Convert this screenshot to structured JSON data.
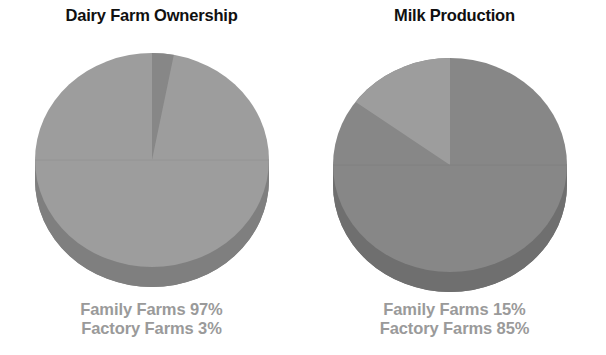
{
  "page": {
    "background": "#ffffff",
    "width": 606,
    "height": 355
  },
  "colors": {
    "title_text": "#101010",
    "legend_text": "#9a9a9a",
    "slice_light": "#9d9d9d",
    "slice_dark": "#878787",
    "slice_edge_light": "#7f7f7f",
    "slice_edge_dark": "#6f6f6f"
  },
  "charts": [
    {
      "title": "Dairy Farm Ownership",
      "legend": [
        {
          "label": "Family Farms 97%"
        },
        {
          "label": "Factory Farms 3%"
        }
      ]
    },
    {
      "title": "Milk Production",
      "legend": [
        {
          "label": "Family Farms 15%"
        },
        {
          "label": "Factory Farms 85%"
        }
      ]
    }
  ],
  "chart_data": [
    {
      "type": "pie",
      "title": "Dairy Farm Ownership",
      "labels": [
        "Family Farms",
        "Factory Farms"
      ],
      "values": [
        97,
        3
      ],
      "value_unit": "percent",
      "data_labels": [
        "Family Farms 97%",
        "Factory Farms 3%"
      ],
      "colors": [
        "#9d9d9d",
        "#878787"
      ],
      "three_d": true,
      "start_angle_deg": 90,
      "direction": "counterclockwise",
      "legend_position": "below",
      "grid": false
    },
    {
      "type": "pie",
      "title": "Milk Production",
      "labels": [
        "Family Farms",
        "Factory Farms"
      ],
      "values": [
        15,
        85
      ],
      "value_unit": "percent",
      "data_labels": [
        "Family Farms 15%",
        "Factory Farms 85%"
      ],
      "colors": [
        "#9d9d9d",
        "#878787"
      ],
      "three_d": true,
      "start_angle_deg": 90,
      "direction": "counterclockwise",
      "legend_position": "below",
      "grid": false
    }
  ]
}
